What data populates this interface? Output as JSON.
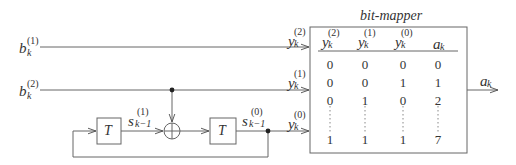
{
  "diagram": {
    "title": "bit-mapper",
    "inputs": [
      {
        "base": "b",
        "sub": "k",
        "sup": "(1)"
      },
      {
        "base": "b",
        "sub": "k",
        "sup": "(2)"
      }
    ],
    "delay_label": "T",
    "states": [
      {
        "base": "s",
        "sub": "k−1",
        "sup": "(1)"
      },
      {
        "base": "s",
        "sub": "k−1",
        "sup": "(0)"
      }
    ],
    "mapper_inputs": [
      {
        "base": "y",
        "sub": "k",
        "sup": "(2)"
      },
      {
        "base": "y",
        "sub": "k",
        "sup": "(1)"
      },
      {
        "base": "y",
        "sub": "k",
        "sup": "(0)"
      }
    ],
    "output": {
      "base": "a",
      "sub": "k"
    },
    "adder_symbol": "⊕",
    "table": {
      "headers": [
        {
          "base": "y",
          "sub": "k",
          "sup": "(2)"
        },
        {
          "base": "y",
          "sub": "k",
          "sup": "(1)"
        },
        {
          "base": "y",
          "sub": "k",
          "sup": "(0)"
        },
        {
          "base": "a",
          "sub": "k",
          "sup": ""
        }
      ],
      "rows": [
        [
          "0",
          "0",
          "0",
          "0"
        ],
        [
          "0",
          "0",
          "1",
          "1"
        ],
        [
          "0",
          "1",
          "0",
          "2"
        ],
        [
          "1",
          "1",
          "1",
          "7"
        ]
      ],
      "ellipsis": "⋮"
    }
  }
}
